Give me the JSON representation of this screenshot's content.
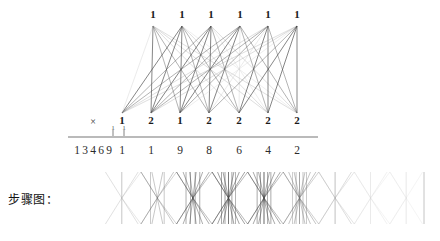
{
  "page": {
    "background": "#ffffff",
    "width": 440,
    "height": 241
  },
  "labels": {
    "step_diagram": "步骤图：",
    "multiply_sign": "×"
  },
  "colors": {
    "ink": "#1a1a1a",
    "line_dark": "#3a3a3a",
    "line_mid": "#8a8a8a",
    "line_light": "#c9c9c9",
    "rule": "#777777"
  },
  "chart_data": {
    "type": "diagram",
    "top_row": {
      "label": "multiplicand digits (top nodes)",
      "digits": [
        "1",
        "1",
        "1",
        "1",
        "1",
        "1"
      ],
      "x": [
        153,
        182,
        211,
        240,
        268,
        297
      ],
      "y": 20
    },
    "bottom_row": {
      "label": "multiplier digits (bottom nodes)",
      "digits": [
        "1",
        "2",
        "1",
        "2",
        "2",
        "2",
        "2"
      ],
      "x": [
        122,
        151,
        180,
        209,
        239,
        268,
        297
      ],
      "y": 120
    },
    "edges": {
      "kind": "complete-bipartite",
      "from_count": 6,
      "to_count": 7,
      "total": 42
    },
    "carry_row": {
      "digits": [
        "1",
        "1"
      ],
      "x": [
        113,
        124
      ],
      "y": 130
    },
    "left_operand": {
      "digits": [
        "1",
        "3",
        "4",
        "6",
        "9"
      ],
      "x": [
        77,
        85,
        93,
        101,
        109
      ],
      "y": 151
    },
    "result_row": {
      "digits": [
        "1",
        "1",
        "9",
        "8",
        "6",
        "4",
        "2"
      ],
      "x": [
        122,
        151,
        180,
        209,
        239,
        268,
        297
      ],
      "y": 151
    },
    "rule_line": {
      "x1": 68,
      "x2": 318,
      "y": 137
    },
    "step_strip": {
      "label": "步骤图：",
      "x_start": 104,
      "x_end": 424,
      "y_top": 172,
      "y_bottom": 224,
      "columns": 9,
      "column_values": [
        "1",
        "2",
        "4",
        "6",
        "8",
        "9",
        "1",
        "1",
        "1"
      ],
      "note": "Each column shows the crossing pattern (number of intersection points) for one product column."
    }
  }
}
